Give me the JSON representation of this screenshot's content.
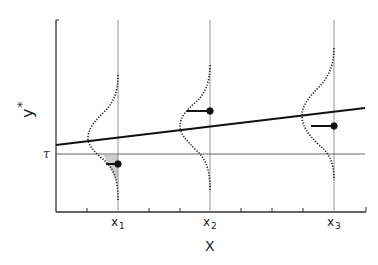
{
  "figure": {
    "y_axis_label": "y",
    "y_axis_label_sup": "*",
    "x_axis_label": "X",
    "threshold_label": "τ",
    "x_ticks": [
      {
        "name": "x",
        "sub": "1"
      },
      {
        "name": "x",
        "sub": "2"
      },
      {
        "name": "x",
        "sub": "3"
      }
    ]
  },
  "colors": {
    "ink": "#222222",
    "guide": "#777777"
  }
}
